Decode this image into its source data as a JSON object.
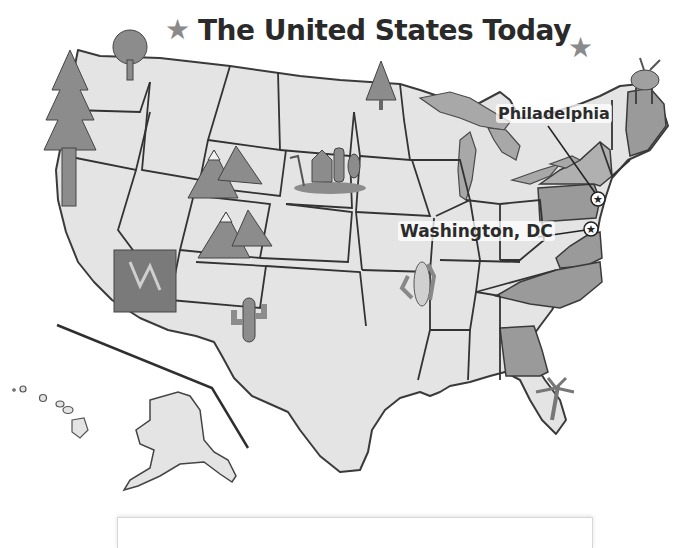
{
  "title": "The United States Today",
  "title_decorations": [
    "star-icon",
    "star-icon"
  ],
  "cities": [
    {
      "name": "Philadelphia",
      "marker": "star-in-circle-icon"
    },
    {
      "name": "Washington, DC",
      "marker": "star-in-circle-icon"
    }
  ],
  "highlighted_states": [
    "Pennsylvania",
    "Virginia",
    "North Carolina",
    "Georgia",
    "Maryland",
    "New York",
    "Massachusetts",
    "Maine"
  ],
  "illustrations": [
    {
      "icon": "evergreen-tree-icon",
      "region": "California"
    },
    {
      "icon": "deciduous-tree-icon",
      "region": "Washington"
    },
    {
      "icon": "mountains-icon",
      "region": "Wyoming"
    },
    {
      "icon": "mountains-icon",
      "region": "Colorado"
    },
    {
      "icon": "farm-barn-icon",
      "region": "South Dakota"
    },
    {
      "icon": "evergreen-tree-icon",
      "region": "Minnesota"
    },
    {
      "icon": "canyon-icon",
      "region": "Arizona"
    },
    {
      "icon": "cactus-icon",
      "region": "New Mexico"
    },
    {
      "icon": "corn-icon",
      "region": "Missouri"
    },
    {
      "icon": "palm-tree-icon",
      "region": "Florida"
    },
    {
      "icon": "moose-icon",
      "region": "Maine"
    }
  ],
  "colors": {
    "land": "#e4e4e4",
    "highlight": "#9a9a9a",
    "border": "#3a3a3a",
    "illustration": "#8c8c8c",
    "text": "#2b2b2b"
  }
}
